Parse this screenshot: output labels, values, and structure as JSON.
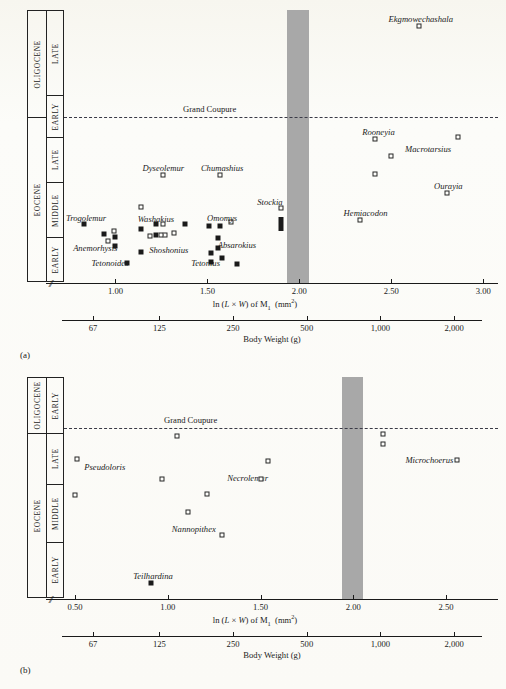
{
  "figure": {
    "panels": [
      {
        "letter": "(a)",
        "strat_outer": [
          {
            "label": "OLIGOCENE",
            "rows": 2
          },
          {
            "label": "EOCENE",
            "rows": 3
          }
        ],
        "strat_inner": [
          "LATE",
          "EARLY",
          "LATE",
          "MIDDLE",
          "EARLY"
        ],
        "coupure_label": "Grand Coupure",
        "x_axis": {
          "title_parts": {
            "ln": "ln (",
            "L": "L",
            "times": " × ",
            "W": "W",
            "close": ") of M",
            "sub": "1",
            "units": "  (mm",
            "sup": "2",
            "end": ")"
          },
          "title_text": "ln (L × W) of M₁  (mm²)",
          "ticks": [
            "1.00",
            "1.50",
            "2.00",
            "2.50",
            "3.00"
          ],
          "tick_values": [
            1.0,
            1.5,
            2.0,
            2.5,
            3.0
          ],
          "range": [
            0.72,
            3.08
          ]
        },
        "weight_axis": {
          "title": "Body Weight (g)",
          "ticks": [
            "67",
            "125",
            "250",
            "500",
            "1,000",
            "2,000"
          ],
          "tick_values": [
            67,
            125,
            250,
            500,
            1000,
            2000
          ]
        },
        "grey_band": {
          "from": 1.93,
          "to": 2.05
        }
      },
      {
        "letter": "(b)",
        "strat_outer": [
          {
            "label": "OLIGOCENE",
            "rows": 1
          },
          {
            "label": "EOCENE",
            "rows": 3
          }
        ],
        "strat_inner": [
          "EARLY",
          "LATE",
          "MIDDLE",
          "EARLY"
        ],
        "coupure_label": "Grand Coupure",
        "x_axis": {
          "title_text": "ln (L × W) of M₁  (mm²)",
          "ticks": [
            "0.50",
            "1.00",
            "1.50",
            "2.00",
            "2.50"
          ],
          "tick_values": [
            0.5,
            1.0,
            1.5,
            2.0,
            2.5
          ],
          "range": [
            0.44,
            2.78
          ]
        },
        "weight_axis": {
          "title": "Body Weight (g)",
          "ticks": [
            "67",
            "125",
            "250",
            "500",
            "1,000",
            "2,000"
          ],
          "tick_values": [
            67,
            125,
            250,
            500,
            1000,
            2000
          ]
        },
        "grey_band": {
          "from": 1.94,
          "to": 2.05
        }
      }
    ]
  },
  "chart_data": [
    {
      "type": "scatter",
      "panel": "a",
      "title": "",
      "xlabel": "ln (L × W) of M₁  (mm²)",
      "ylabel": "Epoch / Age",
      "xlim": [
        0.72,
        3.08
      ],
      "grid": false,
      "legend": "none",
      "secondary_xlabel": "Body Weight (g)",
      "annotations": [
        "Grand Coupure"
      ],
      "points": [
        {
          "taxon": "Ekgmowechashala",
          "x": 2.65,
          "y_px": 26,
          "marker": "open",
          "label_x": 2.66,
          "label_y_px": 14
        },
        {
          "taxon": "Rooneyia",
          "x": 2.41,
          "y_px": 139,
          "marker": "open",
          "label_x": 2.43,
          "label_y_px": 127
        },
        {
          "taxon": "Macrotarsius",
          "x": 2.5,
          "y_px": 156,
          "marker": "open",
          "label_x": 2.7,
          "label_y_px": 144
        },
        {
          "taxon": "",
          "x": 2.86,
          "y_px": 137,
          "marker": "open",
          "label_x": null,
          "label_y_px": null
        },
        {
          "taxon": "Ourayia",
          "x": 2.8,
          "y_px": 193,
          "marker": "open",
          "label_x": 2.81,
          "label_y_px": 181
        },
        {
          "taxon": "",
          "x": 2.41,
          "y_px": 174,
          "marker": "open",
          "label_x": null,
          "label_y_px": null
        },
        {
          "taxon": "Dyseolemur",
          "x": 1.26,
          "y_px": 175,
          "marker": "open",
          "label_x": 1.26,
          "label_y_px": 163
        },
        {
          "taxon": "Chumashius",
          "x": 1.57,
          "y_px": 175,
          "marker": "open",
          "label_x": 1.58,
          "label_y_px": 163
        },
        {
          "taxon": "Stockia",
          "x": 1.9,
          "y_px": 208,
          "marker": "open",
          "label_x": 1.84,
          "label_y_px": 197
        },
        {
          "taxon": "Hemiacodon",
          "x": 2.33,
          "y_px": 220,
          "marker": "open",
          "label_x": 2.36,
          "label_y_px": 208
        },
        {
          "taxon": "Trogolemur",
          "x": 0.83,
          "y_px": 224,
          "marker": "filled",
          "label_x": 0.84,
          "label_y_px": 213
        },
        {
          "taxon": "Washakius",
          "x": 1.14,
          "y_px": 207,
          "marker": "open",
          "label_x": 1.22,
          "label_y_px": 214
        },
        {
          "taxon": "Omomys",
          "x": 1.63,
          "y_px": 222,
          "marker": "open",
          "label_x": 1.58,
          "label_y_px": 213
        },
        {
          "taxon": "Anemorhysis",
          "x": 0.96,
          "y_px": 241,
          "marker": "open",
          "label_x": 0.89,
          "label_y_px": 243
        },
        {
          "taxon": "Shoshonius",
          "x": 1.27,
          "y_px": 235,
          "marker": "open",
          "label_x": 1.29,
          "label_y_px": 245
        },
        {
          "taxon": "Absarokius",
          "x": 1.56,
          "y_px": 238,
          "marker": "filled",
          "label_x": 1.66,
          "label_y_px": 240
        },
        {
          "taxon": "Tetonoides",
          "x": 1.06,
          "y_px": 263,
          "marker": "filled",
          "label_x": 0.97,
          "label_y_px": 258
        },
        {
          "taxon": "Tetonius",
          "x": 1.52,
          "y_px": 253,
          "marker": "filled",
          "label_x": 1.49,
          "label_y_px": 258
        },
        {
          "taxon": "",
          "x": 1.22,
          "y_px": 224,
          "marker": "filled"
        },
        {
          "taxon": "",
          "x": 1.26,
          "y_px": 224,
          "marker": "open"
        },
        {
          "taxon": "",
          "x": 1.38,
          "y_px": 224,
          "marker": "filled"
        },
        {
          "taxon": "",
          "x": 1.51,
          "y_px": 226,
          "marker": "filled"
        },
        {
          "taxon": "",
          "x": 1.57,
          "y_px": 226,
          "marker": "filled"
        },
        {
          "taxon": "",
          "x": 1.14,
          "y_px": 229,
          "marker": "filled"
        },
        {
          "taxon": "",
          "x": 0.99,
          "y_px": 231,
          "marker": "open"
        },
        {
          "taxon": "",
          "x": 0.94,
          "y_px": 234,
          "marker": "filled"
        },
        {
          "taxon": "",
          "x": 1.0,
          "y_px": 237,
          "marker": "filled"
        },
        {
          "taxon": "",
          "x": 1.22,
          "y_px": 235,
          "marker": "filled"
        },
        {
          "taxon": "",
          "x": 1.25,
          "y_px": 235,
          "marker": "open"
        },
        {
          "taxon": "",
          "x": 1.32,
          "y_px": 233,
          "marker": "open"
        },
        {
          "taxon": "",
          "x": 1.19,
          "y_px": 236,
          "marker": "open"
        },
        {
          "taxon": "",
          "x": 1.0,
          "y_px": 246,
          "marker": "filled"
        },
        {
          "taxon": "",
          "x": 1.56,
          "y_px": 248,
          "marker": "filled"
        },
        {
          "taxon": "",
          "x": 1.14,
          "y_px": 252,
          "marker": "filled"
        },
        {
          "taxon": "",
          "x": 1.52,
          "y_px": 262,
          "marker": "filled"
        },
        {
          "taxon": "",
          "x": 1.58,
          "y_px": 258,
          "marker": "filled"
        },
        {
          "taxon": "",
          "x": 1.66,
          "y_px": 264,
          "marker": "filled"
        },
        {
          "taxon": "",
          "x": 1.9,
          "y_px": 224,
          "marker": "tall"
        }
      ]
    },
    {
      "type": "scatter",
      "panel": "b",
      "title": "",
      "xlabel": "ln (L × W) of M₁  (mm²)",
      "ylabel": "Epoch / Age",
      "xlim": [
        0.44,
        2.78
      ],
      "grid": false,
      "legend": "none",
      "secondary_xlabel": "Body Weight (g)",
      "annotations": [
        "Grand Coupure"
      ],
      "points": [
        {
          "taxon": "",
          "x": 1.05,
          "y_px": 436,
          "marker": "open"
        },
        {
          "taxon": "",
          "x": 2.16,
          "y_px": 434,
          "marker": "open"
        },
        {
          "taxon": "",
          "x": 2.16,
          "y_px": 444,
          "marker": "open"
        },
        {
          "taxon": "Microchoerus",
          "x": 2.56,
          "y_px": 460,
          "marker": "open",
          "label_x": 2.41,
          "label_y_px": 455
        },
        {
          "taxon": "Pseudoloris",
          "x": 0.51,
          "y_px": 459,
          "marker": "open",
          "label_x": 0.66,
          "label_y_px": 462
        },
        {
          "taxon": "Necrolemur",
          "x": 1.54,
          "y_px": 461,
          "marker": "open",
          "label_x": 1.43,
          "label_y_px": 473
        },
        {
          "taxon": "",
          "x": 0.97,
          "y_px": 479,
          "marker": "open"
        },
        {
          "taxon": "",
          "x": 1.5,
          "y_px": 479,
          "marker": "open"
        },
        {
          "taxon": "",
          "x": 0.5,
          "y_px": 495,
          "marker": "open"
        },
        {
          "taxon": "",
          "x": 1.21,
          "y_px": 494,
          "marker": "open"
        },
        {
          "taxon": "Nannopithex",
          "x": 1.11,
          "y_px": 512,
          "marker": "open",
          "label_x": 1.14,
          "label_y_px": 524
        },
        {
          "taxon": "",
          "x": 1.29,
          "y_px": 535,
          "marker": "open"
        },
        {
          "taxon": "Teilhardina",
          "x": 0.91,
          "y_px": 583,
          "marker": "filled",
          "label_x": 0.92,
          "label_y_px": 571
        }
      ]
    }
  ]
}
